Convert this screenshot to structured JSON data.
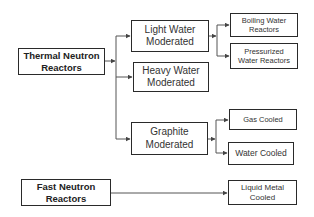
{
  "diagram": {
    "type": "tree",
    "nodes": {
      "thermal": "Thermal Neutron Reactors",
      "light_water": "Light Water Moderated",
      "heavy_water": "Heavy Water Moderated",
      "graphite": "Graphite Moderated",
      "boiling": "Boiling Water Reactors",
      "pressurized": "Pressurized Water Reactors",
      "gas_cooled": "Gas Cooled",
      "water_cooled": "Water Cooled",
      "fast": "Fast Neutron Reactors",
      "liquid_metal": "Liquid Metal Cooled"
    },
    "edges": [
      [
        "thermal",
        "light_water"
      ],
      [
        "thermal",
        "heavy_water"
      ],
      [
        "thermal",
        "graphite"
      ],
      [
        "light_water",
        "boiling"
      ],
      [
        "light_water",
        "pressurized"
      ],
      [
        "graphite",
        "gas_cooled"
      ],
      [
        "graphite",
        "water_cooled"
      ],
      [
        "fast",
        "liquid_metal"
      ]
    ],
    "colors": {
      "line": "#555555",
      "border": "#2a2a2a",
      "text": "#333333"
    }
  }
}
